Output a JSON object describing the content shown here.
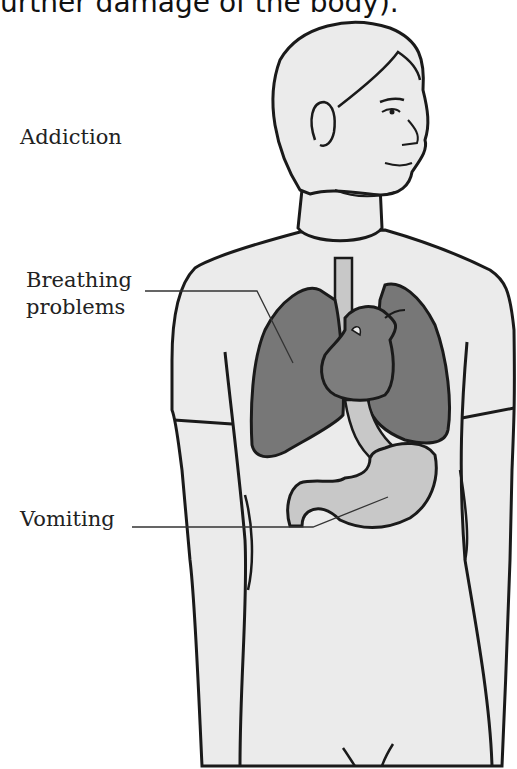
{
  "caption": {
    "text": "urther damage of the body)."
  },
  "labels": {
    "addiction": "Addiction",
    "breathing_line1": "Breathing",
    "breathing_line2": "problems",
    "vomiting": "Vomiting"
  },
  "colors": {
    "skin": "#ebebeb",
    "outline": "#1a1a1a",
    "lungs": "#777777",
    "heart": "#7d7d7d",
    "stomach": "#c8c8c8",
    "esophagus": "#c8c8c8",
    "leader_line": "#333333"
  },
  "figure": {
    "organs": [
      "lungs",
      "heart",
      "esophagus",
      "stomach",
      "trachea"
    ]
  }
}
